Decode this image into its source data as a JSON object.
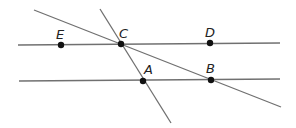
{
  "diagram": {
    "type": "geometry",
    "lines": [
      {
        "id": "line-ECD",
        "x1": 18,
        "y1": 45,
        "x2": 280,
        "y2": 43
      },
      {
        "id": "line-AB",
        "x1": 19,
        "y1": 81,
        "x2": 280,
        "y2": 79
      },
      {
        "id": "transversal-CB",
        "x1": 34,
        "y1": 10,
        "x2": 281,
        "y2": 107
      },
      {
        "id": "transversal-CA",
        "x1": 100,
        "y1": 9,
        "x2": 171,
        "y2": 123
      }
    ],
    "points": [
      {
        "label": "E",
        "x": 61,
        "y": 45,
        "lx": 56,
        "ly": 39
      },
      {
        "label": "C",
        "x": 121,
        "y": 44,
        "lx": 119,
        "ly": 38
      },
      {
        "label": "D",
        "x": 210,
        "y": 43,
        "lx": 205,
        "ly": 37
      },
      {
        "label": "A",
        "x": 143,
        "y": 81,
        "lx": 144,
        "ly": 74
      },
      {
        "label": "B",
        "x": 211,
        "y": 80,
        "lx": 206,
        "ly": 73
      }
    ]
  }
}
